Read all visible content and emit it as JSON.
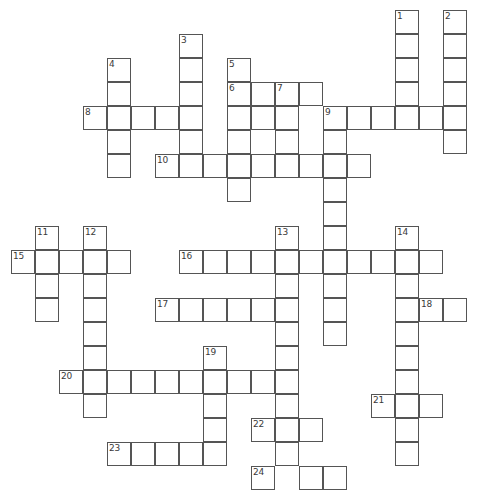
{
  "puzzle": {
    "title": "Crossword Puzzle Grid",
    "grid": {
      "cell_size": 24,
      "origin_x": 11,
      "origin_y": 10,
      "columns": 20,
      "rows": 21,
      "border_color": "#555555",
      "cell_color": "#ffffff",
      "background_color": "#ffffff",
      "number_color": "#3a3a3a"
    },
    "entries": [
      {
        "number": "1",
        "direction": "down",
        "col": 16,
        "row": 0,
        "length": 5
      },
      {
        "number": "2",
        "direction": "down",
        "col": 18,
        "row": 0,
        "length": 6
      },
      {
        "number": "3",
        "direction": "down",
        "col": 7,
        "row": 1,
        "length": 6
      },
      {
        "number": "4",
        "direction": "down",
        "col": 4,
        "row": 2,
        "length": 5
      },
      {
        "number": "5",
        "direction": "down",
        "col": 9,
        "row": 2,
        "length": 6
      },
      {
        "number": "6",
        "direction": "across",
        "col": 9,
        "row": 3,
        "length": 4
      },
      {
        "number": "7",
        "direction": "down",
        "col": 11,
        "row": 3,
        "length": 4
      },
      {
        "number": "8",
        "direction": "across",
        "col": 3,
        "row": 4,
        "length": 5
      },
      {
        "number": "9",
        "direction": "across",
        "col": 13,
        "row": 4,
        "length": 6
      },
      {
        "number": "9",
        "direction": "down",
        "col": 13,
        "row": 4,
        "length": 10
      },
      {
        "number": "10",
        "direction": "across",
        "col": 6,
        "row": 6,
        "length": 9
      },
      {
        "number": "11",
        "direction": "down",
        "col": 1,
        "row": 9,
        "length": 4
      },
      {
        "number": "12",
        "direction": "down",
        "col": 3,
        "row": 9,
        "length": 8
      },
      {
        "number": "13",
        "direction": "down",
        "col": 11,
        "row": 9,
        "length": 10
      },
      {
        "number": "14",
        "direction": "down",
        "col": 16,
        "row": 9,
        "length": 10
      },
      {
        "number": "15",
        "direction": "across",
        "col": 0,
        "row": 10,
        "length": 5
      },
      {
        "number": "16",
        "direction": "across",
        "col": 7,
        "row": 10,
        "length": 11
      },
      {
        "number": "17",
        "direction": "across",
        "col": 6,
        "row": 12,
        "length": 6
      },
      {
        "number": "18",
        "direction": "across",
        "col": 16,
        "row": 12,
        "length": 3
      },
      {
        "number": "19",
        "direction": "down",
        "col": 8,
        "row": 14,
        "length": 5
      },
      {
        "number": "20",
        "direction": "across",
        "col": 2,
        "row": 15,
        "length": 8
      },
      {
        "number": "21",
        "direction": "across",
        "col": 15,
        "row": 16,
        "length": 3
      },
      {
        "number": "22",
        "direction": "across",
        "col": 10,
        "row": 17,
        "length": 3
      },
      {
        "number": "23",
        "direction": "across",
        "col": 4,
        "row": 18,
        "length": 5
      },
      {
        "number": "24",
        "direction": "across",
        "col": 10,
        "row": 19,
        "length": 4
      }
    ],
    "cells": [
      {
        "col": 16,
        "row": 0,
        "number": "1"
      },
      {
        "col": 16,
        "row": 1
      },
      {
        "col": 16,
        "row": 2
      },
      {
        "col": 16,
        "row": 3
      },
      {
        "col": 16,
        "row": 4
      },
      {
        "col": 18,
        "row": 0,
        "number": "2"
      },
      {
        "col": 18,
        "row": 1
      },
      {
        "col": 18,
        "row": 2
      },
      {
        "col": 18,
        "row": 3
      },
      {
        "col": 18,
        "row": 4
      },
      {
        "col": 18,
        "row": 5
      },
      {
        "col": 7,
        "row": 1,
        "number": "3"
      },
      {
        "col": 7,
        "row": 2
      },
      {
        "col": 7,
        "row": 3
      },
      {
        "col": 7,
        "row": 4
      },
      {
        "col": 7,
        "row": 5
      },
      {
        "col": 7,
        "row": 6
      },
      {
        "col": 4,
        "row": 2,
        "number": "4"
      },
      {
        "col": 4,
        "row": 3
      },
      {
        "col": 4,
        "row": 4
      },
      {
        "col": 4,
        "row": 5
      },
      {
        "col": 4,
        "row": 6
      },
      {
        "col": 9,
        "row": 2,
        "number": "5"
      },
      {
        "col": 9,
        "row": 3,
        "number": "6"
      },
      {
        "col": 10,
        "row": 3
      },
      {
        "col": 11,
        "row": 3,
        "number": "7"
      },
      {
        "col": 12,
        "row": 3
      },
      {
        "col": 9,
        "row": 4
      },
      {
        "col": 10,
        "row": 4
      },
      {
        "col": 11,
        "row": 4
      },
      {
        "col": 9,
        "row": 5
      },
      {
        "col": 11,
        "row": 5
      },
      {
        "col": 9,
        "row": 6
      },
      {
        "col": 9,
        "row": 7
      },
      {
        "col": 3,
        "row": 4,
        "number": "8"
      },
      {
        "col": 5,
        "row": 4
      },
      {
        "col": 6,
        "row": 4
      },
      {
        "col": 13,
        "row": 4,
        "number": "9"
      },
      {
        "col": 14,
        "row": 4
      },
      {
        "col": 15,
        "row": 4
      },
      {
        "col": 17,
        "row": 4
      },
      {
        "col": 13,
        "row": 5
      },
      {
        "col": 13,
        "row": 6
      },
      {
        "col": 13,
        "row": 7
      },
      {
        "col": 13,
        "row": 8
      },
      {
        "col": 13,
        "row": 9
      },
      {
        "col": 13,
        "row": 10
      },
      {
        "col": 13,
        "row": 11
      },
      {
        "col": 13,
        "row": 12
      },
      {
        "col": 13,
        "row": 13
      },
      {
        "col": 6,
        "row": 6,
        "number": "10"
      },
      {
        "col": 8,
        "row": 6
      },
      {
        "col": 10,
        "row": 6
      },
      {
        "col": 11,
        "row": 6
      },
      {
        "col": 12,
        "row": 6
      },
      {
        "col": 14,
        "row": 6
      },
      {
        "col": 1,
        "row": 9,
        "number": "11"
      },
      {
        "col": 1,
        "row": 10
      },
      {
        "col": 1,
        "row": 11
      },
      {
        "col": 1,
        "row": 12
      },
      {
        "col": 3,
        "row": 9,
        "number": "12"
      },
      {
        "col": 3,
        "row": 10
      },
      {
        "col": 3,
        "row": 11
      },
      {
        "col": 3,
        "row": 12
      },
      {
        "col": 3,
        "row": 13
      },
      {
        "col": 3,
        "row": 14
      },
      {
        "col": 3,
        "row": 15
      },
      {
        "col": 3,
        "row": 16
      },
      {
        "col": 11,
        "row": 9,
        "number": "13"
      },
      {
        "col": 11,
        "row": 10
      },
      {
        "col": 11,
        "row": 11
      },
      {
        "col": 11,
        "row": 12
      },
      {
        "col": 11,
        "row": 13
      },
      {
        "col": 11,
        "row": 14
      },
      {
        "col": 11,
        "row": 15
      },
      {
        "col": 11,
        "row": 16
      },
      {
        "col": 11,
        "row": 17
      },
      {
        "col": 11,
        "row": 18
      },
      {
        "col": 16,
        "row": 9,
        "number": "14"
      },
      {
        "col": 16,
        "row": 10
      },
      {
        "col": 16,
        "row": 11
      },
      {
        "col": 16,
        "row": 12
      },
      {
        "col": 16,
        "row": 13
      },
      {
        "col": 16,
        "row": 14
      },
      {
        "col": 16,
        "row": 15
      },
      {
        "col": 16,
        "row": 16
      },
      {
        "col": 16,
        "row": 17
      },
      {
        "col": 16,
        "row": 18
      },
      {
        "col": 0,
        "row": 10,
        "number": "15"
      },
      {
        "col": 2,
        "row": 10
      },
      {
        "col": 4,
        "row": 10
      },
      {
        "col": 7,
        "row": 10,
        "number": "16"
      },
      {
        "col": 8,
        "row": 10
      },
      {
        "col": 9,
        "row": 10
      },
      {
        "col": 10,
        "row": 10
      },
      {
        "col": 12,
        "row": 10
      },
      {
        "col": 14,
        "row": 10
      },
      {
        "col": 15,
        "row": 10
      },
      {
        "col": 17,
        "row": 10
      },
      {
        "col": 6,
        "row": 12,
        "number": "17"
      },
      {
        "col": 7,
        "row": 12
      },
      {
        "col": 8,
        "row": 12
      },
      {
        "col": 9,
        "row": 12
      },
      {
        "col": 10,
        "row": 12
      },
      {
        "col": 17,
        "row": 12,
        "number": "18"
      },
      {
        "col": 18,
        "row": 12
      },
      {
        "col": 8,
        "row": 14,
        "number": "19"
      },
      {
        "col": 8,
        "row": 15
      },
      {
        "col": 8,
        "row": 16
      },
      {
        "col": 8,
        "row": 17
      },
      {
        "col": 8,
        "row": 18
      },
      {
        "col": 2,
        "row": 15,
        "number": "20"
      },
      {
        "col": 4,
        "row": 15
      },
      {
        "col": 5,
        "row": 15
      },
      {
        "col": 6,
        "row": 15
      },
      {
        "col": 7,
        "row": 15
      },
      {
        "col": 9,
        "row": 15
      },
      {
        "col": 10,
        "row": 15
      },
      {
        "col": 15,
        "row": 16,
        "number": "21"
      },
      {
        "col": 17,
        "row": 16
      },
      {
        "col": 10,
        "row": 17,
        "number": "22"
      },
      {
        "col": 12,
        "row": 17
      },
      {
        "col": 4,
        "row": 18,
        "number": "23"
      },
      {
        "col": 5,
        "row": 18
      },
      {
        "col": 6,
        "row": 18
      },
      {
        "col": 7,
        "row": 18
      },
      {
        "col": 10,
        "row": 19,
        "number": "24"
      },
      {
        "col": 12,
        "row": 19
      },
      {
        "col": 13,
        "row": 19
      }
    ]
  }
}
